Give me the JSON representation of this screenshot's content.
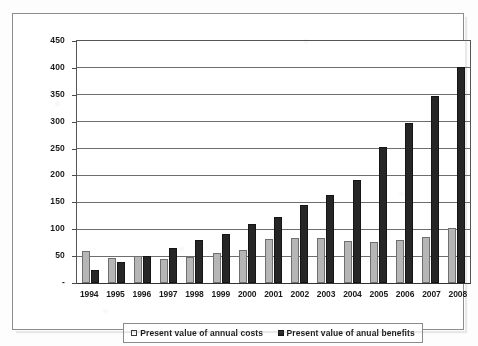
{
  "chart_data": {
    "type": "bar",
    "title": "",
    "xlabel": "",
    "ylabel": "",
    "ylim": [
      0,
      450
    ],
    "ytick_interval": 50,
    "ytick_labels": [
      "450",
      "400",
      "350",
      "300",
      "250",
      "200",
      "150",
      "100",
      "50",
      "-"
    ],
    "ytick_values": [
      450,
      400,
      350,
      300,
      250,
      200,
      150,
      100,
      50,
      0
    ],
    "zero_label": "-",
    "grid": true,
    "grid_axis": "y",
    "legend_position": "bottom",
    "categories": [
      "1994",
      "1995",
      "1996",
      "1997",
      "1998",
      "1999",
      "2000",
      "2001",
      "2002",
      "2003",
      "2004",
      "2005",
      "2006",
      "2007",
      "2008"
    ],
    "series": [
      {
        "name": "Present value of annual costs",
        "color": "#b6b6b6",
        "swatch": "hollow-square",
        "values": [
          60,
          47,
          50,
          45,
          48,
          56,
          62,
          82,
          83,
          84,
          78,
          76,
          80,
          85,
          102
        ]
      },
      {
        "name": "Present value of anual benefits",
        "color": "#262626",
        "swatch": "filled-square",
        "values": [
          25,
          40,
          50,
          65,
          80,
          92,
          110,
          123,
          145,
          163,
          192,
          253,
          298,
          348,
          402
        ]
      }
    ]
  },
  "legend": {
    "items": [
      {
        "label": "Present value of annual costs",
        "swatch": "hollow-square-icon"
      },
      {
        "label": "Present value of anual benefits",
        "swatch": "filled-square-icon"
      }
    ]
  }
}
